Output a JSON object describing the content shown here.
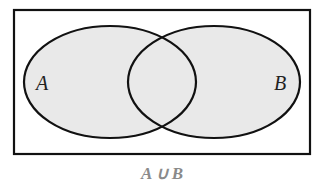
{
  "diagram": {
    "type": "venn",
    "sets": [
      {
        "label": "A",
        "shaded": true
      },
      {
        "label": "B",
        "shaded": true
      }
    ],
    "caption": "A ∪ B",
    "colors": {
      "fill": "#e8e8e8",
      "stroke": "#111111",
      "caption": "#8a8a8a"
    }
  }
}
